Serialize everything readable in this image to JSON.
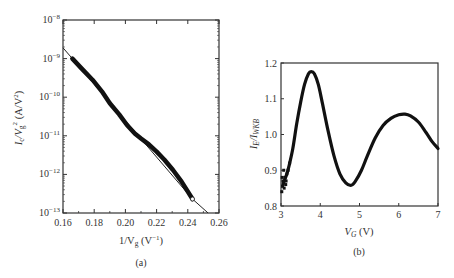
{
  "chart_data": [
    {
      "id": "a",
      "type": "line",
      "caption": "(a)",
      "title": "",
      "xlabel": "1/V_g (V^-1)",
      "ylabel": "I_c/V_g^2 (A/V^2)",
      "xscale": "linear",
      "yscale": "log",
      "xlim": [
        0.16,
        0.26
      ],
      "ylim": [
        1e-13,
        1e-08
      ],
      "xticks": [
        0.16,
        0.18,
        0.2,
        0.22,
        0.24,
        0.26
      ],
      "xtick_labels": [
        "0.16",
        "0.18",
        "0.20",
        "0.22",
        "0.24",
        "0.26"
      ],
      "yticks": [
        1e-13,
        1e-12,
        1e-11,
        1e-10,
        1e-09,
        1e-08
      ],
      "ytick_labels": [
        {
          "base": "10",
          "exp": "-13"
        },
        {
          "base": "10",
          "exp": "-12"
        },
        {
          "base": "10",
          "exp": "-11"
        },
        {
          "base": "10",
          "exp": "-10"
        },
        {
          "base": "10",
          "exp": "-9"
        },
        {
          "base": "10",
          "exp": "-8"
        }
      ],
      "grid": false,
      "legend": null,
      "series": [
        {
          "name": "measured data (Fowler-Nordheim plot)",
          "style": "thick-markers",
          "x": [
            0.166,
            0.172,
            0.179,
            0.185,
            0.19,
            0.196,
            0.201,
            0.206,
            0.21,
            0.215,
            0.22,
            0.225,
            0.2305,
            0.236,
            0.243
          ],
          "y": [
            1e-09,
            5.5e-10,
            2.8e-10,
            1.4e-10,
            7e-11,
            3.6e-11,
            1.9e-11,
            1.15e-11,
            8.5e-12,
            6e-12,
            3.9e-12,
            2.4e-12,
            1.3e-12,
            6.5e-13,
            2.3e-13
          ]
        },
        {
          "name": "fit",
          "style": "thin-line",
          "x": [
            0.16,
            0.166,
            0.243,
            0.253
          ],
          "y": [
            1.9e-09,
            1e-09,
            2.3e-13,
            1e-13
          ]
        }
      ]
    },
    {
      "id": "b",
      "type": "scatter",
      "caption": "(b)",
      "title": "",
      "xlabel": "V_G (V)",
      "ylabel": "I_E/I_WKB",
      "xlim": [
        3,
        7
      ],
      "ylim": [
        0.8,
        1.2
      ],
      "xticks": [
        3,
        4,
        5,
        6,
        7
      ],
      "xtick_labels": [
        "3",
        "4",
        "5",
        "6",
        "7"
      ],
      "yticks": [
        0.8,
        0.9,
        1.0,
        1.1,
        1.2
      ],
      "ytick_labels": [
        "0.8",
        "0.9",
        "1.0",
        "1.1",
        "1.2"
      ],
      "grid": false,
      "legend": null,
      "series": [
        {
          "name": "I_E/I_WKB",
          "x": [
            3.05,
            3.1,
            3.15,
            3.2,
            3.3,
            3.4,
            3.5,
            3.6,
            3.7,
            3.77,
            3.85,
            3.95,
            4.05,
            4.2,
            4.35,
            4.5,
            4.65,
            4.79,
            4.9,
            5.05,
            5.2,
            5.4,
            5.6,
            5.8,
            6.0,
            6.16,
            6.3,
            6.5,
            6.7,
            6.85,
            7.0
          ],
          "y": [
            0.86,
            0.875,
            0.89,
            0.91,
            0.96,
            1.03,
            1.09,
            1.14,
            1.17,
            1.176,
            1.17,
            1.14,
            1.09,
            1.01,
            0.94,
            0.89,
            0.865,
            0.858,
            0.87,
            0.9,
            0.94,
            0.99,
            1.025,
            1.045,
            1.055,
            1.057,
            1.052,
            1.035,
            1.005,
            0.98,
            0.961
          ]
        }
      ]
    }
  ],
  "plot_a": {
    "caption": "(a)",
    "xlabel": {
      "prefix": "1/V",
      "sub": "g",
      "unit_open": " (V",
      "unit_sup": "−1",
      "unit_close": ")"
    },
    "ylabel": {
      "p1": "I",
      "p1_sub": "c",
      "p2": "/V",
      "p2_sub": "g",
      "p2_sup": "2",
      "unit": " (A/V",
      "unit_sup": "2",
      "unit_close": ")"
    }
  },
  "plot_b": {
    "caption": "(b)",
    "xlabel": {
      "v": "V",
      "sub": "G",
      "unit": " (V)"
    },
    "ylabel": {
      "p1": "I",
      "p1_sub": "E",
      "p2": "/I",
      "p2_sub": "WKB"
    }
  }
}
